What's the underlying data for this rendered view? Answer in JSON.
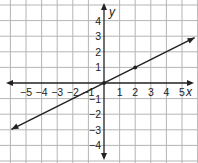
{
  "chart_data": {
    "type": "line",
    "title": "",
    "xlabel": "x",
    "ylabel": "y",
    "xlim": [
      -6,
      6
    ],
    "ylim": [
      -5,
      5
    ],
    "grid": true,
    "x_ticks": [
      -5,
      -4,
      -3,
      -2,
      -1,
      1,
      2,
      3,
      4,
      5
    ],
    "y_ticks": [
      -4,
      -3,
      -2,
      -1,
      1,
      2,
      3,
      4
    ],
    "x_tick_labels": [
      "−5",
      "−4",
      "−3",
      "−2",
      "−1",
      "1",
      "2",
      "3",
      "4",
      "5"
    ],
    "y_tick_labels": [
      "−4",
      "−3",
      "−2",
      "−1",
      "1",
      "2",
      "3",
      "4"
    ],
    "series": [
      {
        "name": "line",
        "equation": "y = 0.5x",
        "slope": 0.5,
        "intercept": 0,
        "x": [
          -6,
          6
        ],
        "y": [
          -3,
          3
        ],
        "arrows_both_ends": true,
        "marked_points": [
          [
            0,
            0
          ],
          [
            2,
            1
          ]
        ],
        "color": "#222222"
      }
    ]
  },
  "colors": {
    "grid": "#b5b5b5",
    "axis": "#222222",
    "line": "#222222",
    "background": "#ffffff"
  }
}
